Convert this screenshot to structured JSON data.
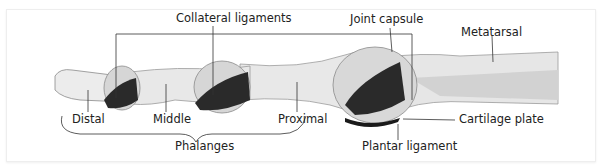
{
  "diagram": {
    "labels": {
      "collateral_ligaments": "Collateral ligaments",
      "joint_capsule": "Joint capsule",
      "metatarsal": "Metatarsal",
      "distal": "Distal",
      "middle": "Middle",
      "proximal": "Proximal",
      "cartilage_plate": "Cartilage plate",
      "phalanges": "Phalanges",
      "plantar_ligament": "Plantar ligament"
    },
    "colors": {
      "bone_light": "#ececec",
      "bone_mid": "#d6d6d6",
      "ligament_dark": "#2a2a2a",
      "capsule": "#c8c8c8",
      "line": "#333333"
    }
  }
}
